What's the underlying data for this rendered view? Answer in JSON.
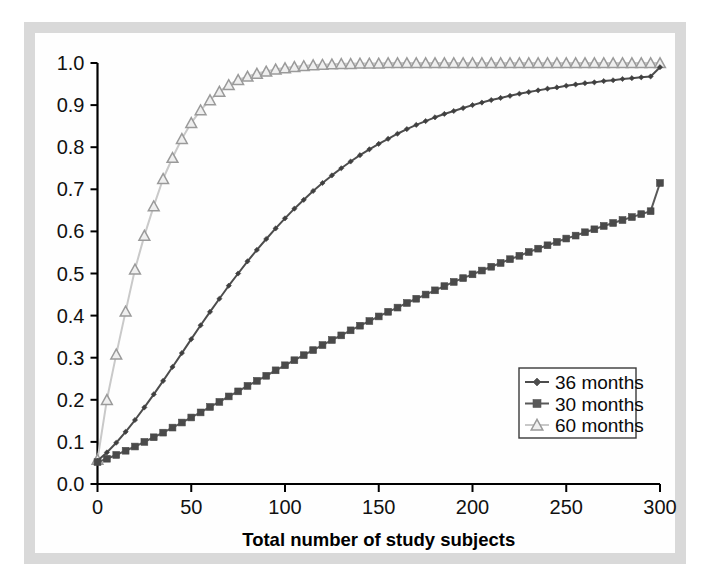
{
  "figure": {
    "background_color": "#ffffff",
    "frame_color": "#d9d9d9",
    "plot_background": "#fefefe"
  },
  "chart_data": {
    "type": "line",
    "title": "",
    "xlabel": "Total number of study subjects",
    "ylabel": "",
    "xlim": [
      0,
      300
    ],
    "ylim": [
      0.0,
      1.0
    ],
    "xticks": [
      0,
      50,
      100,
      150,
      200,
      250,
      300
    ],
    "xtick_labels": [
      "0",
      "50",
      "100",
      "150",
      "200",
      "250",
      "300"
    ],
    "yticks": [
      0.0,
      0.1,
      0.2,
      0.3,
      0.4,
      0.5,
      0.6,
      0.7,
      0.8,
      0.9,
      1.0
    ],
    "ytick_labels": [
      "0.0",
      "0.1",
      "0.2",
      "0.3",
      "0.4",
      "0.5",
      "0.6",
      "0.7",
      "0.8",
      "0.9",
      "1.0"
    ],
    "grid": false,
    "legend_position": "center-right",
    "x": [
      0,
      5,
      10,
      15,
      20,
      25,
      30,
      35,
      40,
      45,
      50,
      55,
      60,
      65,
      70,
      75,
      80,
      85,
      90,
      95,
      100,
      105,
      110,
      115,
      120,
      125,
      130,
      135,
      140,
      145,
      150,
      155,
      160,
      165,
      170,
      175,
      180,
      185,
      190,
      195,
      200,
      205,
      210,
      215,
      220,
      225,
      230,
      235,
      240,
      245,
      250,
      255,
      260,
      265,
      270,
      275,
      280,
      285,
      290,
      295,
      300
    ],
    "series": [
      {
        "name": "36 months",
        "color": "#4d4d4d",
        "marker": "diamond",
        "marker_color": "#3f3f3f",
        "values": [
          0.055,
          0.075,
          0.098,
          0.124,
          0.152,
          0.182,
          0.213,
          0.245,
          0.278,
          0.311,
          0.344,
          0.377,
          0.409,
          0.44,
          0.471,
          0.5,
          0.529,
          0.556,
          0.582,
          0.607,
          0.631,
          0.654,
          0.675,
          0.696,
          0.715,
          0.733,
          0.75,
          0.766,
          0.781,
          0.795,
          0.808,
          0.82,
          0.832,
          0.843,
          0.853,
          0.862,
          0.871,
          0.879,
          0.886,
          0.893,
          0.9,
          0.906,
          0.912,
          0.917,
          0.922,
          0.927,
          0.931,
          0.935,
          0.939,
          0.942,
          0.946,
          0.949,
          0.952,
          0.954,
          0.957,
          0.959,
          0.962,
          0.964,
          0.966,
          0.968,
          0.99
        ]
      },
      {
        "name": "30 months",
        "color": "#595959",
        "marker": "square",
        "marker_color": "#4a4a4a",
        "values": [
          0.052,
          0.06,
          0.069,
          0.079,
          0.089,
          0.1,
          0.111,
          0.122,
          0.134,
          0.146,
          0.158,
          0.17,
          0.183,
          0.195,
          0.208,
          0.22,
          0.233,
          0.245,
          0.257,
          0.27,
          0.282,
          0.294,
          0.306,
          0.318,
          0.33,
          0.342,
          0.353,
          0.365,
          0.376,
          0.387,
          0.398,
          0.409,
          0.419,
          0.43,
          0.44,
          0.45,
          0.46,
          0.47,
          0.48,
          0.489,
          0.498,
          0.507,
          0.516,
          0.525,
          0.534,
          0.542,
          0.551,
          0.559,
          0.567,
          0.575,
          0.583,
          0.59,
          0.598,
          0.605,
          0.613,
          0.62,
          0.627,
          0.634,
          0.641,
          0.648,
          0.715
        ]
      },
      {
        "name": "60 months",
        "color": "#c9c9c9",
        "marker": "triangle",
        "marker_color": "#9a9a9a",
        "values": [
          0.058,
          0.2,
          0.308,
          0.41,
          0.51,
          0.59,
          0.66,
          0.725,
          0.775,
          0.82,
          0.858,
          0.888,
          0.912,
          0.932,
          0.948,
          0.96,
          0.968,
          0.975,
          0.98,
          0.985,
          0.988,
          0.991,
          0.993,
          0.995,
          0.996,
          0.997,
          0.998,
          0.998,
          0.999,
          0.999,
          0.999,
          1.0,
          1.0,
          1.0,
          1.0,
          1.0,
          1.0,
          1.0,
          1.0,
          1.0,
          1.0,
          1.0,
          1.0,
          1.0,
          1.0,
          1.0,
          1.0,
          1.0,
          1.0,
          1.0,
          1.0,
          1.0,
          1.0,
          1.0,
          1.0,
          1.0,
          1.0,
          1.0,
          1.0,
          1.0,
          1.0
        ]
      }
    ],
    "legend": [
      {
        "label": "36 months",
        "marker": "diamond",
        "color": "#4d4d4d"
      },
      {
        "label": "30 months",
        "marker": "square",
        "color": "#595959"
      },
      {
        "label": "60 months",
        "marker": "triangle",
        "color": "#c9c9c9"
      }
    ]
  }
}
